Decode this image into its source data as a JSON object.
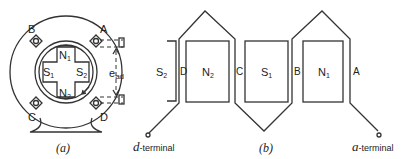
{
  "figure_a": {
    "caption": "(a)",
    "poles": {
      "n1": "N",
      "n1_sub": "1",
      "n2": "N",
      "n2_sub": "2",
      "s1": "S",
      "s1_sub": "1",
      "s2": "S",
      "s2_sub": "2"
    },
    "brushes": {
      "a": "A",
      "b": "B",
      "c": "C",
      "d": "D"
    },
    "voltage": "e",
    "voltage_sub": "ad"
  },
  "figure_b": {
    "caption": "(b)",
    "poles": [
      {
        "name": "S",
        "sub": "2"
      },
      {
        "name": "N",
        "sub": "2"
      },
      {
        "name": "S",
        "sub": "1"
      },
      {
        "name": "N",
        "sub": "1"
      }
    ],
    "conductors": {
      "d": "D",
      "c": "C",
      "b": "B",
      "a": "A"
    },
    "d_terminal": {
      "letter": "d",
      "suffix": "-terminal"
    },
    "a_terminal": {
      "letter": "a",
      "suffix": "-terminal"
    }
  },
  "colors": {
    "line": "#333333",
    "text": "#222222",
    "background": "#ffffff"
  }
}
